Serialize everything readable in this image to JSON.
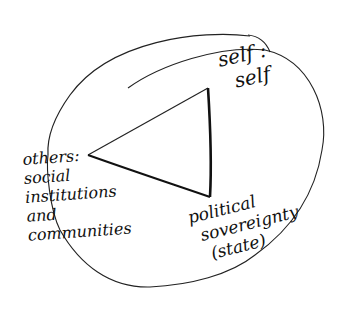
{
  "diagram": {
    "type": "hand-drawn triangle diagram within ellipse",
    "background": "#ffffff",
    "ink_color": "#111111",
    "nodes": [
      {
        "id": "self",
        "lines": [
          "self :",
          "self"
        ]
      },
      {
        "id": "others",
        "lines": [
          "others:",
          "social",
          "institutions",
          "and",
          "communities"
        ]
      },
      {
        "id": "state",
        "lines": [
          "political",
          "sovereignty",
          "(state)"
        ]
      }
    ],
    "edges": [
      {
        "from": "others",
        "to": "self"
      },
      {
        "from": "self",
        "to": "state"
      },
      {
        "from": "state",
        "to": "others"
      }
    ]
  }
}
